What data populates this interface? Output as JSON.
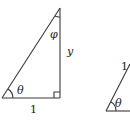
{
  "diagram": {
    "triangle_left": {
      "base_label": "1",
      "vertical_label": "y",
      "bottom_angle_label": "θ",
      "top_angle_label": "φ",
      "right_angle_marker": true
    },
    "triangle_right": {
      "hypotenuse_label": "1",
      "bottom_angle_label": "θ"
    }
  }
}
